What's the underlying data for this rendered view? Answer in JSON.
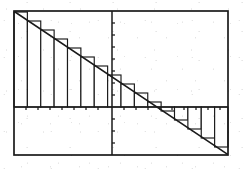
{
  "figure": {
    "ink_color": "#1a1a1a",
    "fill_color": "#ffffff",
    "background_color": "#ffffff",
    "frame": {
      "x": 14,
      "y": 11,
      "width": 214,
      "height": 144
    },
    "axes": {
      "x_axis_y": 107,
      "y_axis_x": 112,
      "tick_length": 3,
      "x_ticks": [
        26,
        38,
        50,
        62,
        74,
        86,
        98,
        124,
        136,
        148,
        160,
        172,
        184,
        196,
        208,
        220
      ],
      "y_ticks": [
        23,
        35,
        47,
        59,
        71,
        83,
        95,
        119,
        131,
        143
      ]
    },
    "line": {
      "label": "y = f(x) descending diagonal",
      "x1": 15,
      "y1": 12,
      "x2": 227,
      "y2": 154,
      "stroke_width": 1.6
    }
  },
  "chart_data": {
    "type": "bar",
    "subtitle": "Left-endpoint rule, signed area",
    "xlabel": "",
    "ylabel": "",
    "grid": false,
    "legend": false,
    "xlim": [
      14,
      228
    ],
    "ylim": [
      -48,
      96
    ],
    "baseline": 0,
    "function": "linear, decreasing",
    "rule": "left-endpoint",
    "bar_count": 16,
    "bar_width_px": 13.3,
    "categories": [
      "x0",
      "x1",
      "x2",
      "x3",
      "x4",
      "x5",
      "x6",
      "x7",
      "x8",
      "x9",
      "x10",
      "x11",
      "x12",
      "x13",
      "x14",
      "x15"
    ],
    "values": [
      95,
      86,
      77,
      68,
      59,
      50,
      41,
      32,
      23,
      14,
      5,
      -4,
      -13,
      -22,
      -31,
      -40
    ],
    "annotations": [
      {
        "text": "positive area above axis",
        "region": "left"
      },
      {
        "text": "negative area below axis",
        "region": "right"
      }
    ]
  }
}
